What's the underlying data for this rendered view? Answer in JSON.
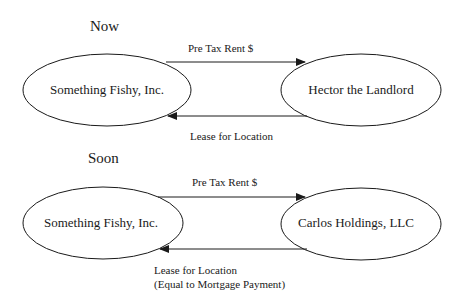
{
  "diagrams": [
    {
      "title": "Now",
      "nodes": {
        "left": "Something Fishy, Inc.",
        "right": "Hector the Landlord"
      },
      "edges": {
        "top": "Pre Tax Rent $",
        "bottom": [
          "Lease for Location"
        ]
      }
    },
    {
      "title": "Soon",
      "nodes": {
        "left": "Something Fishy, Inc.",
        "right": "Carlos Holdings, LLC"
      },
      "edges": {
        "top": "Pre Tax Rent $",
        "bottom": [
          "Lease for Location",
          "(Equal to Mortgage Payment)"
        ]
      }
    }
  ]
}
